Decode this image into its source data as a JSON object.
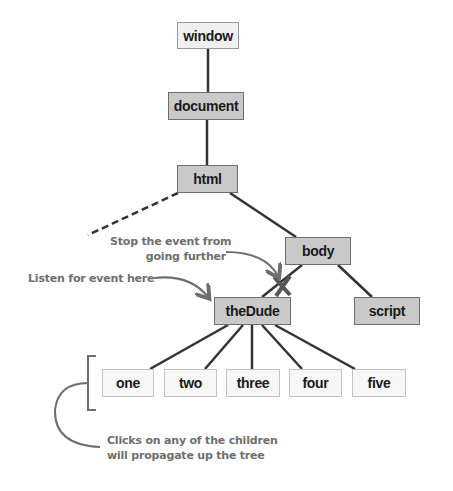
{
  "diagram": {
    "nodes": {
      "window": "window",
      "document": "document",
      "html": "html",
      "body": "body",
      "thedude": "theDude",
      "script": "script",
      "children": [
        "one",
        "two",
        "three",
        "four",
        "five"
      ]
    },
    "annotations": {
      "stop_line1": "Stop the event from",
      "stop_line2": "going further",
      "listen": "Listen for event here",
      "clicks_line1": "Clicks on any of the children",
      "clicks_line2": "will propagate up the tree"
    },
    "colors": {
      "line": "#333333",
      "annotation": "#6e6e6e",
      "ancestor_fill": "#c9c9c9",
      "child_fill": "#f7f7f7"
    }
  }
}
